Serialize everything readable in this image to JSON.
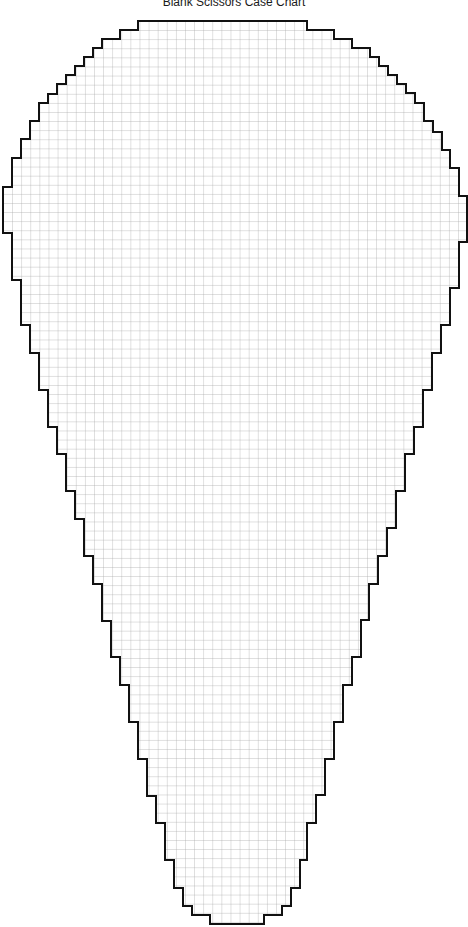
{
  "title": "Blank Scissors Case Chart",
  "chart": {
    "cell_size_px": 9.1,
    "grid_color": "#9a9a9a",
    "outline_color": "#111111",
    "fill_color": "#ffffff",
    "outline_points": "165,21 307,21 307,30 334,30 334,39 352,39 352,48 370,48 370,57 379,57 379,66 388,66 388,75 397,75 397,84 406,84 406,93 415,93 415,103 424,103 424,121 433,121 433,132 442,132 442,150 450,150 450,168 459,168 459,196 467,196 467,242 459,242 459,288 450,288 450,325 441,325 441,353 432,353 432,390 423,390 423,427 414,427 414,454 405,454 405,491 396,491 396,528 387,528 387,556 378,556 378,584 369,584 369,620 361,620 361,657 352,657 352,685 343,685 343,722 334,722 334,759 325,759 325,795 316,795 316,823 307,823 307,860 300,860 300,888 291,888 291,906 282,906 282,915 264,915 264,924 210,924 210,915 192,915 192,906 183,906 183,888 174,888 174,860 165,860 165,823 156,823 156,796 147,796 147,759 138,759 138,722 129,722 129,685 120,685 120,657 111,657 111,621 102,621 102,584 93,584 93,556 84,556 84,519 75,519 75,491 66,491 66,454 57,454 57,427 48,427 48,390 39,390 39,353 30,353 30,325 21,325 21,280 12,280 12,233 3,233 3,187 12,187 12,158 21,158 21,139 30,139 30,121 39,121 39,103 48,103 48,94 57,94 57,84 66,84 66,75 75,75 75,66 84,66 84,57 93,57 93,48 102,48 102,39 120,39 120,30 138,30 138,21"
  }
}
